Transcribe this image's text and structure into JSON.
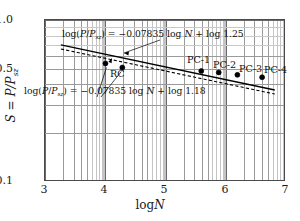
{
  "chart_data": {
    "type": "scatter",
    "title": "",
    "xlabel": "log N",
    "ylabel": "S = P/P_sz",
    "xlim": [
      3,
      7
    ],
    "ylim": [
      0.1,
      1.0
    ],
    "yscale": "log",
    "xscale": "linear",
    "grid": true,
    "legend": "none",
    "xticks": [
      "3",
      "4",
      "5",
      "6",
      "7"
    ],
    "xtick_values": [
      3,
      4,
      5,
      6,
      7
    ],
    "yticks": [
      "0.1",
      "0.5",
      "1.0"
    ],
    "ytick_values": [
      0.1,
      0.5,
      1.0
    ],
    "series": [
      {
        "name": "specimens",
        "marker": "filled-circle",
        "points": [
          {
            "label": "RC",
            "x": 4.02,
            "y": 0.532
          },
          {
            "label": "RC",
            "x": 4.3,
            "y": 0.502
          },
          {
            "label": "PC-1",
            "x": 5.61,
            "y": 0.478
          },
          {
            "label": "PC-2",
            "x": 5.9,
            "y": 0.468
          },
          {
            "label": "PC-3",
            "x": 6.21,
            "y": 0.452
          },
          {
            "label": "PC-4",
            "x": 6.62,
            "y": 0.437
          }
        ]
      }
    ],
    "fit_lines": [
      {
        "name": "upper-solid-fit",
        "style": "solid",
        "slope": -0.07835,
        "intercept_log10": 0.09691,
        "intercept_label": "log 1.25",
        "x_start": 3.28,
        "x_end": 6.83
      },
      {
        "name": "lower-dashed-fit",
        "style": "dashed",
        "slope": -0.07835,
        "intercept_log10": 0.07188,
        "intercept_label": "log 1.18",
        "x_start": 3.28,
        "x_end": 6.83
      }
    ],
    "annotations": {
      "equation_upper": "log(P/P_sz) = −0.07835 log N + log 1.25",
      "equation_lower": "log(P/P_sz) = −0.07835 log N + log 1.18"
    },
    "colors": {
      "axis": "#4a4a4a",
      "grid_major": "#6a6a6a",
      "grid_minor": "#9a9a9a",
      "grid_faint": "#c4c4c4",
      "data": "#000000",
      "text": "#111111"
    }
  },
  "axes": {
    "x_label_rm": "log",
    "x_label_it": "N",
    "y_label_text": "S = P/P",
    "y_label_sub": "sz",
    "yticks": [
      {
        "text": "1.0",
        "value": 1.0
      },
      {
        "text": "0.5",
        "value": 0.5
      },
      {
        "text": "0.1",
        "value": 0.1
      }
    ],
    "xticks": [
      {
        "text": "3",
        "value": 3
      },
      {
        "text": "4",
        "value": 4
      },
      {
        "text": "5",
        "value": 5
      },
      {
        "text": "6",
        "value": 6
      },
      {
        "text": "7",
        "value": 7
      }
    ]
  },
  "equations": {
    "upper": {
      "lead": "log(",
      "p": "P",
      "slash": "/",
      "psz": "P",
      "psz_sub": "sz",
      "tail_open": ") = ",
      "coef": "−0.07835 ",
      "logn_rm": "log ",
      "logn_it": "N",
      "plus": " + ",
      "logc": "log 1.25"
    },
    "lower": {
      "lead": "log(",
      "p": "P",
      "slash": "/",
      "psz": "P",
      "psz_sub": "sz",
      "tail_open": ") = ",
      "coef": "−0.07835 ",
      "logn_rm": "log ",
      "logn_it": "N",
      "plus": " + ",
      "logc": "log 1.18"
    }
  },
  "point_labels": [
    {
      "text": "RC",
      "left": 110,
      "top": 68
    },
    {
      "text": "PC-1",
      "left": 187,
      "top": 54
    },
    {
      "text": "PC-2",
      "left": 213,
      "top": 59
    },
    {
      "text": "PC-3",
      "left": 239,
      "top": 63
    },
    {
      "text": "PC-4",
      "left": 264,
      "top": 64
    }
  ]
}
